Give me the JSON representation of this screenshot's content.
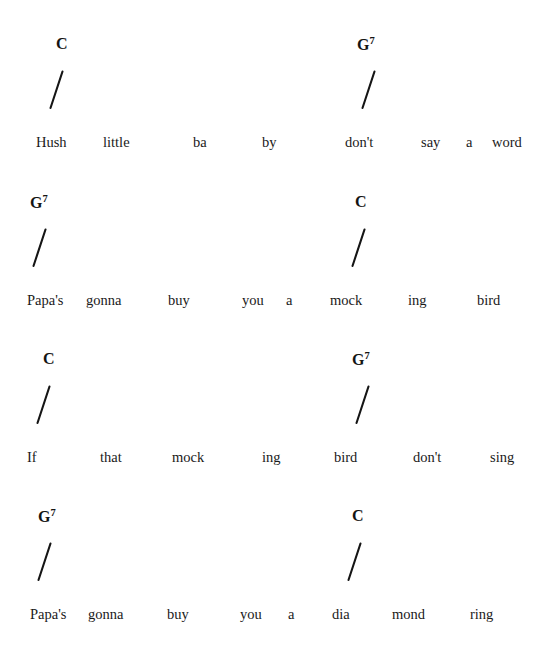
{
  "document": {
    "type": "chord-chart",
    "title": "Hush Little Baby",
    "background_color": "#ffffff",
    "text_color": "#1a1a1a",
    "strum_mark": "/"
  },
  "lines": [
    {
      "id": "line-1",
      "chords": [
        {
          "root": "C",
          "ext": "",
          "x": 56,
          "slash_x": 48
        },
        {
          "root": "G",
          "ext": "7",
          "x": 357,
          "slash_x": 360
        }
      ],
      "lyrics": [
        {
          "text": "Hush",
          "x": 36
        },
        {
          "text": "little",
          "x": 103
        },
        {
          "text": "ba",
          "x": 193
        },
        {
          "text": "by",
          "x": 262
        },
        {
          "text": "don't",
          "x": 345
        },
        {
          "text": "say",
          "x": 421
        },
        {
          "text": "a",
          "x": 466
        },
        {
          "text": "word",
          "x": 492
        }
      ]
    },
    {
      "id": "line-2",
      "chords": [
        {
          "root": "G",
          "ext": "7",
          "x": 30,
          "slash_x": 31
        },
        {
          "root": "C",
          "ext": "",
          "x": 355,
          "slash_x": 350
        }
      ],
      "lyrics": [
        {
          "text": "Papa's",
          "x": 27
        },
        {
          "text": "gonna",
          "x": 86
        },
        {
          "text": "buy",
          "x": 168
        },
        {
          "text": "you",
          "x": 242
        },
        {
          "text": "a",
          "x": 286
        },
        {
          "text": "mock",
          "x": 330
        },
        {
          "text": "ing",
          "x": 408
        },
        {
          "text": "bird",
          "x": 477
        }
      ]
    },
    {
      "id": "line-3",
      "chords": [
        {
          "root": "C",
          "ext": "",
          "x": 43,
          "slash_x": 35
        },
        {
          "root": "G",
          "ext": "7",
          "x": 352,
          "slash_x": 354
        }
      ],
      "lyrics": [
        {
          "text": "If",
          "x": 27
        },
        {
          "text": "that",
          "x": 100
        },
        {
          "text": "mock",
          "x": 172
        },
        {
          "text": "ing",
          "x": 262
        },
        {
          "text": "bird",
          "x": 334
        },
        {
          "text": "don't",
          "x": 413
        },
        {
          "text": "sing",
          "x": 490
        }
      ]
    },
    {
      "id": "line-4",
      "chords": [
        {
          "root": "G",
          "ext": "7",
          "x": 38,
          "slash_x": 36
        },
        {
          "root": "C",
          "ext": "",
          "x": 352,
          "slash_x": 346
        }
      ],
      "lyrics": [
        {
          "text": "Papa's",
          "x": 30
        },
        {
          "text": "gonna",
          "x": 88
        },
        {
          "text": "buy",
          "x": 167
        },
        {
          "text": "you",
          "x": 240
        },
        {
          "text": "a",
          "x": 288
        },
        {
          "text": "dia",
          "x": 332
        },
        {
          "text": "mond",
          "x": 392
        },
        {
          "text": "ring",
          "x": 470
        }
      ]
    }
  ]
}
